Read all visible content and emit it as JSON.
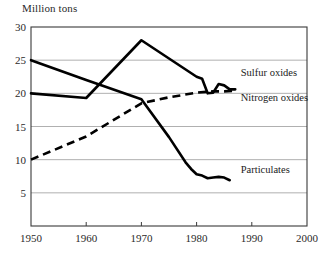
{
  "chart_data": {
    "type": "line",
    "title": "",
    "xlabel": "",
    "ylabel": "Million tons",
    "xlim": [
      1950,
      2000
    ],
    "ylim": [
      0,
      30
    ],
    "grid": true,
    "legend_position": "inline-right",
    "xticks": [
      1950,
      1960,
      1970,
      1980,
      1990,
      2000
    ],
    "yticks": [
      5,
      10,
      15,
      20,
      25,
      30
    ],
    "xtick_labels": [
      "1950",
      "1960",
      "1970",
      "1980",
      "1990",
      "2000"
    ],
    "ytick_labels": [
      "5",
      "10",
      "15",
      "20",
      "25",
      "30"
    ],
    "series": [
      {
        "name": "Sulfur oxides",
        "label": "Sulfur oxides",
        "style": "solid",
        "x": [
          1950,
          1960,
          1970,
          1980,
          1981,
          1982,
          1983,
          1984,
          1985,
          1986,
          1987
        ],
        "values": [
          20.0,
          19.3,
          28.0,
          22.5,
          22.2,
          20.0,
          20.1,
          21.4,
          21.2,
          20.6,
          20.6
        ]
      },
      {
        "name": "Nitrogen oxides",
        "label": "Nitrogen oxides",
        "style": "dashed",
        "x": [
          1950,
          1960,
          1970,
          1975,
          1980,
          1983,
          1985,
          1987
        ],
        "values": [
          10.0,
          13.5,
          18.5,
          19.4,
          20.1,
          20.3,
          20.3,
          20.4
        ]
      },
      {
        "name": "Particulates",
        "label": "Particulates",
        "style": "solid",
        "x": [
          1950,
          1960,
          1970,
          1975,
          1978,
          1979,
          1980,
          1981,
          1982,
          1983,
          1984,
          1985,
          1986
        ],
        "values": [
          25.0,
          22.0,
          19.1,
          13.4,
          9.6,
          8.6,
          7.8,
          7.6,
          7.2,
          7.3,
          7.4,
          7.3,
          6.9
        ]
      }
    ],
    "annotations": [
      {
        "name": "sulfur-oxides-label",
        "text": "Sulfur oxides",
        "x": 1988,
        "y": 22.6
      },
      {
        "name": "nitrogen-oxides-label",
        "text": "Nitrogen oxides",
        "x": 1988,
        "y": 18.9
      },
      {
        "name": "particulates-label",
        "text": "Particulates",
        "x": 1988,
        "y": 8.0
      }
    ]
  },
  "figure": {
    "axis_title": "Million tons",
    "caption": ""
  }
}
